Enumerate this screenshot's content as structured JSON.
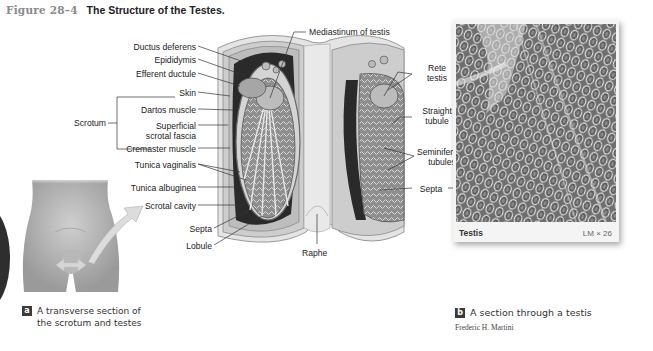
{
  "figure": {
    "number": "Figure 28–4",
    "title": "The Structure of the Testes."
  },
  "panel_a": {
    "badge": "a",
    "caption_line1": "A transverse section of",
    "caption_line2": "the scrotum and testes",
    "labels_left": {
      "ductus_deferens": "Ductus deferens",
      "epididymis": "Epididymis",
      "efferent_ductule": "Efferent ductule",
      "skin": "Skin",
      "scrotum": "Scrotum",
      "dartos_muscle": "Dartos muscle",
      "superficial_1": "Superficial",
      "superficial_2": "scrotal fascia",
      "cremaster_muscle": "Cremaster muscle",
      "tunica_vaginalis": "Tunica vaginalis",
      "tunica_albuginea": "Tunica albuginea",
      "scrotal_cavity": "Scrotal cavity",
      "septa": "Septa",
      "lobule": "Lobule"
    },
    "labels_top": {
      "mediastinum": "Mediastinum of testis"
    },
    "labels_bottom": {
      "raphe": "Raphe"
    },
    "labels_right": {
      "rete_1": "Rete",
      "rete_2": "testis",
      "straight_1": "Straight",
      "straight_2": "tubule",
      "seminiferous_1": "Seminiferous",
      "seminiferous_2": "tubules",
      "septa": "Septa"
    }
  },
  "panel_b": {
    "badge": "b",
    "caption": "A section through a testis",
    "photo_label": "Testis",
    "magnification": "LM × 26",
    "credit": "Frederic H. Martini"
  },
  "colors": {
    "figure_number": "#8a8a8a",
    "badge_bg": "#3a3a3a",
    "leader_line": "#333333",
    "tissue_light": "#d9d9d9",
    "tissue_dark": "#2a2a2a"
  }
}
